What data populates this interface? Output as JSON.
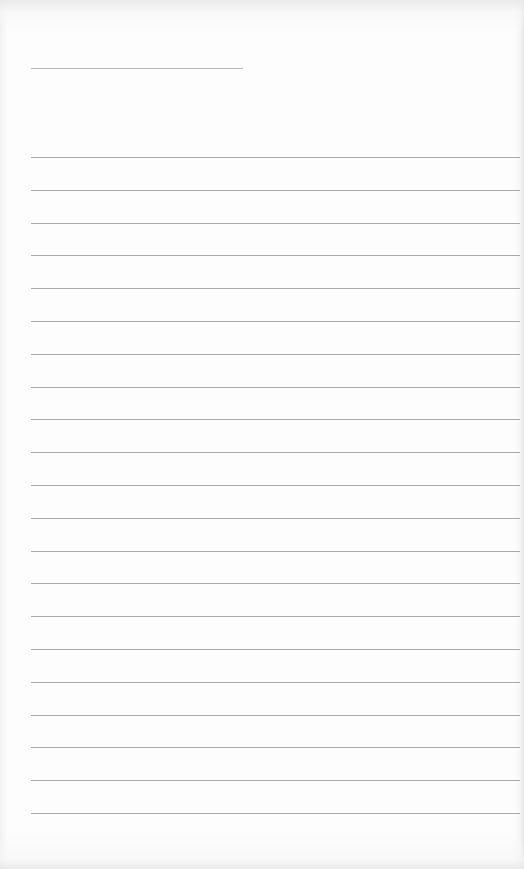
{
  "document": {
    "type": "lined-paper",
    "header_line": {
      "present": true
    },
    "ruled_line_count": 21,
    "line_color": "#a9a9a9",
    "background_color": "#fdfdfd"
  }
}
